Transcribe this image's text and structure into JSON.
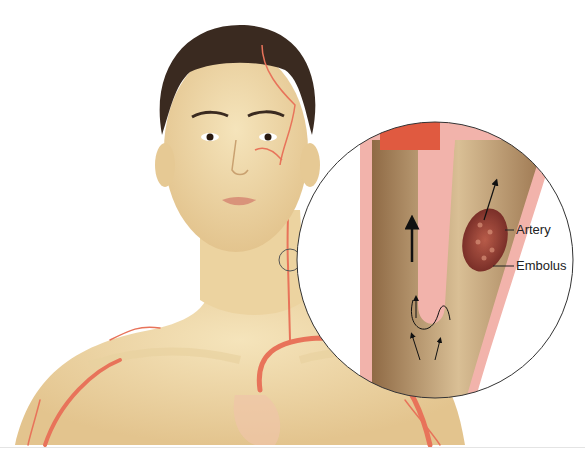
{
  "figure": {
    "labels": [
      {
        "id": "artery",
        "text": "Artery"
      },
      {
        "id": "embolus",
        "text": "Embolus"
      }
    ]
  },
  "colors": {
    "background": "#ffffff",
    "skin": "#f0d9a6",
    "skin_shadow": "#d9b77f",
    "hair": "#3a2a20",
    "artery": "#e8735a",
    "vessel_wall": "#f2b3ab",
    "vessel_lumen": "#b08a60",
    "embolus": "#8c3f35",
    "outline": "#333333"
  }
}
